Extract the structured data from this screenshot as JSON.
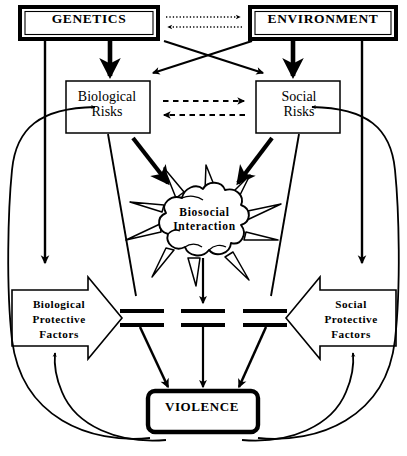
{
  "diagram": {
    "nodes": {
      "genetics": {
        "label": "GENETICS",
        "shape": "double-rect"
      },
      "environment": {
        "label": "ENVIRONMENT",
        "shape": "double-rect"
      },
      "biological_risks": {
        "label": "Biological\nRisks",
        "shape": "rect"
      },
      "social_risks": {
        "label": "Social\nRisks",
        "shape": "rect"
      },
      "biosocial_interaction": {
        "label": "Biosocial\nInteraction",
        "shape": "explosion-burst"
      },
      "biological_protective_factors": {
        "label": "Biological\nProtective\nFactors",
        "shape": "block-arrow-right"
      },
      "social_protective_factors": {
        "label": "Social\nProtective\nFactors",
        "shape": "block-arrow-left"
      },
      "violence": {
        "label": "VIOLENCE",
        "shape": "rounded-rect-bold"
      }
    },
    "edges": [
      {
        "from": "genetics",
        "to": "environment",
        "style": "dotted",
        "direction": "right"
      },
      {
        "from": "environment",
        "to": "genetics",
        "style": "dotted",
        "direction": "left"
      },
      {
        "from": "genetics",
        "to": "biological_risks",
        "style": "solid-thick",
        "direction": "down"
      },
      {
        "from": "environment",
        "to": "social_risks",
        "style": "solid-thick",
        "direction": "down"
      },
      {
        "from": "genetics",
        "to": "social_risks",
        "style": "solid-thin",
        "direction": "diagonal"
      },
      {
        "from": "environment",
        "to": "biological_risks",
        "style": "solid-thin",
        "direction": "diagonal"
      },
      {
        "from": "biological_risks",
        "to": "social_risks",
        "style": "dashed",
        "direction": "right"
      },
      {
        "from": "social_risks",
        "to": "biological_risks",
        "style": "dashed",
        "direction": "left"
      },
      {
        "from": "biological_risks",
        "to": "biosocial_interaction",
        "style": "solid-thick",
        "direction": "down-right"
      },
      {
        "from": "social_risks",
        "to": "biosocial_interaction",
        "style": "solid-thick",
        "direction": "down-left"
      },
      {
        "from": "biosocial_interaction",
        "to": "violence",
        "style": "solid",
        "direction": "down",
        "barrier": true
      },
      {
        "from": "genetics",
        "to": "biological_protective_factors",
        "style": "solid",
        "direction": "down"
      },
      {
        "from": "environment",
        "to": "social_protective_factors",
        "style": "solid",
        "direction": "down"
      },
      {
        "from": "violence",
        "to": "biological_risks",
        "style": "curved-feedback",
        "direction": "up-left"
      },
      {
        "from": "violence",
        "to": "social_risks",
        "style": "curved-feedback",
        "direction": "up-right"
      },
      {
        "from": "violence",
        "to": "biological_protective_factors",
        "style": "curved-feedback",
        "direction": "up"
      },
      {
        "from": "violence",
        "to": "social_protective_factors",
        "style": "curved-feedback",
        "direction": "up"
      }
    ],
    "barriers": {
      "count": 3,
      "description": "protective-factor barrier symbols between biosocial interaction and violence"
    },
    "colors": {
      "stroke": "#000000",
      "background": "#ffffff",
      "text": "#000000"
    }
  }
}
